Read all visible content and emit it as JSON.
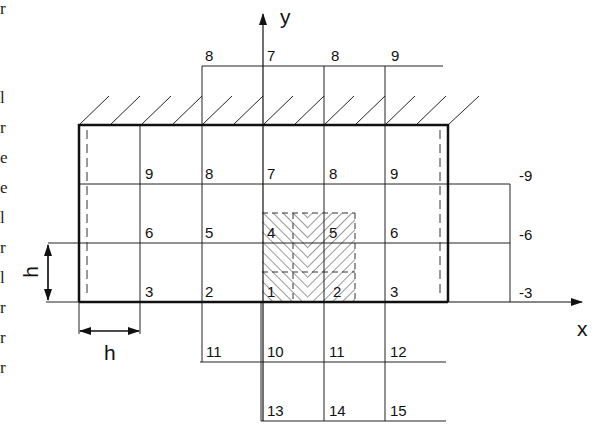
{
  "diagram": {
    "axes": {
      "x_label": "x",
      "y_label": "y"
    },
    "dimension_labels": {
      "horizontal": "h",
      "vertical": "h"
    },
    "top_row_labels": [
      "8",
      "7",
      "8",
      "9"
    ],
    "grid_row_top": [
      "9",
      "8",
      "7",
      "8",
      "9"
    ],
    "grid_row_middle": [
      "6",
      "5",
      "4",
      "5",
      "6"
    ],
    "grid_row_bottom": [
      "3",
      "2",
      "1",
      "2",
      "3"
    ],
    "below_row_1": [
      "11",
      "10",
      "11",
      "12"
    ],
    "below_row_2": [
      "13",
      "14",
      "15"
    ],
    "right_labels": [
      "-9",
      "-6",
      "-3"
    ],
    "left_edge_glyphs": [
      "r",
      "l",
      "r",
      "e",
      "e",
      "l",
      "r",
      "l",
      "r",
      "r",
      "r"
    ]
  }
}
